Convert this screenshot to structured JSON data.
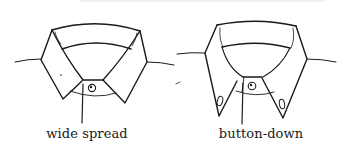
{
  "figure": {
    "panels": [
      {
        "label": "wide spread",
        "style": "wide-spread-collar"
      },
      {
        "label": "button-down",
        "style": "button-down-collar"
      }
    ],
    "line_color": "#1a1a1a"
  }
}
